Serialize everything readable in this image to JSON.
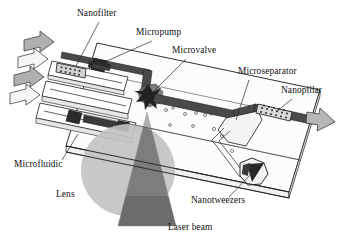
{
  "figure": {
    "background_color": "#ffffff",
    "ink_color": "#111111"
  },
  "labels": [
    {
      "id": "nanofilter",
      "text": "Nanofilter",
      "x": 77,
      "y": 16,
      "anchor": "start"
    },
    {
      "id": "micropump",
      "text": "Micropump",
      "x": 136,
      "y": 35,
      "anchor": "start"
    },
    {
      "id": "microvalve",
      "text": "Microvalve",
      "x": 172,
      "y": 53,
      "anchor": "start"
    },
    {
      "id": "microseparator",
      "text": "Microseparator",
      "x": 238,
      "y": 74,
      "anchor": "start"
    },
    {
      "id": "nanopillar",
      "text": "Nanopillar",
      "x": 281,
      "y": 93,
      "anchor": "start"
    },
    {
      "id": "microfluidic",
      "text": "Microfluidic",
      "x": 14,
      "y": 167,
      "anchor": "start"
    },
    {
      "id": "lens",
      "text": "Lens",
      "x": 56,
      "y": 197,
      "anchor": "start"
    },
    {
      "id": "nanotweezers",
      "text": "Nanotweezers",
      "x": 191,
      "y": 203,
      "anchor": "start"
    },
    {
      "id": "laser-beam",
      "text": "Laser beam",
      "x": 168,
      "y": 230,
      "anchor": "start"
    }
  ],
  "components": {
    "chip_plate": {
      "name": "Microfluidic chip substrate",
      "fill": "#fbfbfb",
      "stroke": "#1a1a1a"
    },
    "inlet_arrows": {
      "name": "Fluid inlet arrows",
      "count": 4,
      "fills": [
        "#b0b0b0",
        "#f2f2f2",
        "#b0b0b0",
        "#f2f2f2"
      ]
    },
    "outlet_arrow": {
      "name": "Fluid outlet arrow",
      "fill": "#b7b7b7"
    },
    "nanofilter": {
      "name": "Nanofilter membrane grid",
      "fill": "#c8c8c8"
    },
    "micropump": {
      "name": "Micropump actuator",
      "fill": "#2e2e2e"
    },
    "microvalve": {
      "name": "Microvalve star actuator",
      "fill": "#272727"
    },
    "microchannel": {
      "name": "Main microchannel",
      "fill": "#4a4a4a"
    },
    "microseparator": {
      "name": "Microseparator junction",
      "fill": "#e9e9e9"
    },
    "nanopillar": {
      "name": "Nanopillar array",
      "fill": "#d6d6d6"
    },
    "nanotweezers": {
      "name": "Nanotweezers chamber",
      "fill": "#2b2b2b"
    },
    "laser_cone": {
      "name": "Laser beam cone",
      "fill": "#9a9a9a"
    },
    "lens": {
      "name": "Focusing lens disc",
      "fill": "#c4c4c4"
    },
    "particles": {
      "name": "Suspended particles in channel",
      "count": 9
    }
  },
  "colors": {
    "ink": "#111111",
    "cone_light": "#b3b3b3",
    "cone_mid": "#8e8e8e",
    "cone_dark": "#6f6f6f",
    "lens_light": "#c9c9c9",
    "channel_dark": "#4a4a4a",
    "actuator_black": "#2b2b2b",
    "arrow_gray": "#b0b0b0",
    "plate": "#fbfbfb"
  }
}
